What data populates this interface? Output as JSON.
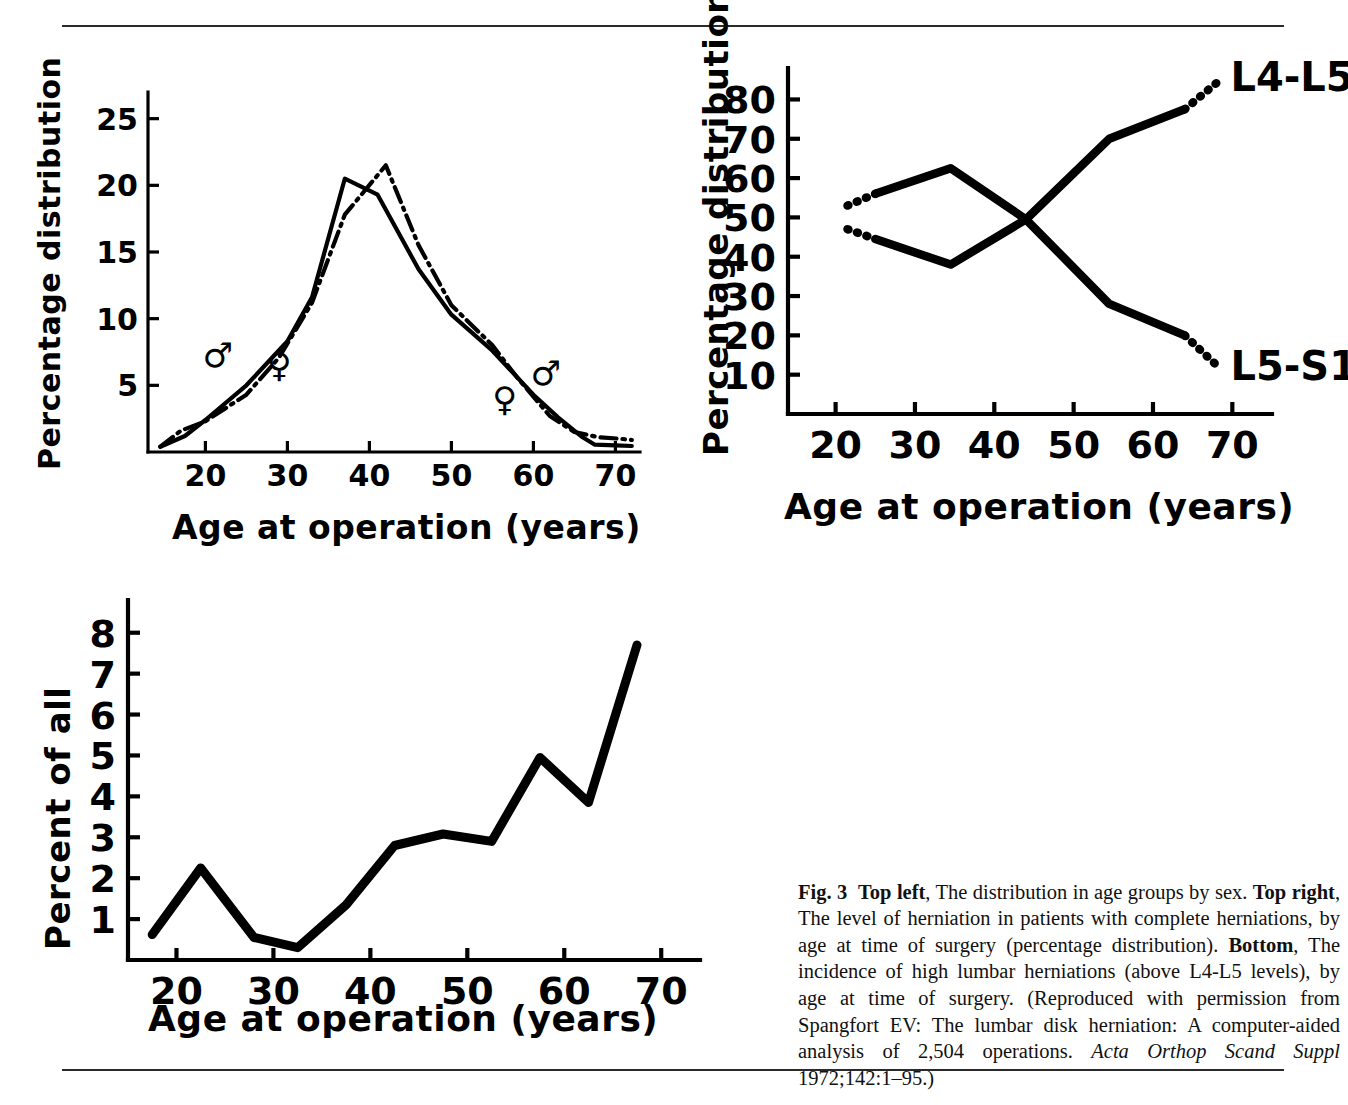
{
  "page": {
    "figure_number": "Fig. 3",
    "rules": [
      "top-rule",
      "bottom-rule"
    ]
  },
  "caption": {
    "figure_label": "Fig. 3",
    "seg_top_left_label": "Top left",
    "seg_top_left_text": ", The distribution in age groups by sex. ",
    "seg_top_right_label": "Top right",
    "seg_top_right_text": ", The level of herniation in patients with complete herniations, by age at time of surgery (percentage distribution). ",
    "seg_bottom_label": "Bottom",
    "seg_bottom_text": ", The incidence of high lumbar herniations (above L4-L5 levels), by age at time of surgery. (Reproduced with permission from Spangfort EV: The lumbar disk herniation: A computer-aided analysis of 2,504 operations. ",
    "journal_italic": "Acta Orthop Scand Suppl",
    "citation_tail": " 1972;142:1–95.)",
    "full_text": "Fig. 3  Top left, The distribution in age groups by sex. Top right, The level of herniation in patients with complete herniations, by age at time of surgery (percentage distribution). Bottom, The incidence of high lumbar herniations (above L4-L5 levels), by age at time of surgery. (Reproduced with permission from Spangfort EV: The lumbar disk herniation: A computer-aided analysis of 2,504 operations. Acta Orthop Scand Suppl 1972;142:1–95.)"
  },
  "chart_data": [
    {
      "id": "top-left",
      "position": "Top left",
      "type": "line",
      "title": "",
      "xlabel": "Age at operation (years)",
      "ylabel": "Percentage distribution",
      "xlim": [
        13,
        73
      ],
      "ylim": [
        0,
        27
      ],
      "xticks": [
        20,
        30,
        40,
        50,
        60,
        70
      ],
      "yticks": [
        5,
        10,
        15,
        20,
        25
      ],
      "grid": false,
      "legend": "inline-symbols",
      "annotations": [
        {
          "label": "♂",
          "name": "male-symbol-left",
          "x": 21.5,
          "y": 6.4
        },
        {
          "label": "♀",
          "name": "female-symbol-left",
          "x": 29.0,
          "y": 5.6
        },
        {
          "label": "♂",
          "name": "male-symbol-right",
          "x": 61.5,
          "y": 5.0
        },
        {
          "label": "♀",
          "name": "female-symbol-right",
          "x": 56.5,
          "y": 3.1
        }
      ],
      "series": [
        {
          "name": "Male",
          "symbol": "♂",
          "style": "solid",
          "x": [
            14.5,
            17.5,
            20,
            25,
            30,
            33,
            37,
            41,
            46,
            50,
            55,
            60,
            63,
            66,
            67.5,
            70,
            72
          ],
          "y": [
            0.4,
            1.2,
            2.4,
            5.0,
            8.3,
            11.6,
            20.5,
            19.3,
            13.7,
            10.3,
            7.6,
            4.3,
            2.6,
            1.1,
            0.55,
            0.5,
            0.45
          ]
        },
        {
          "name": "Female",
          "symbol": "♀",
          "style": "dash-dot",
          "x": [
            14.5,
            17,
            20,
            25,
            29,
            33,
            37,
            42,
            46,
            50,
            55,
            58,
            62,
            65,
            68,
            70.5,
            72
          ],
          "y": [
            0.4,
            1.6,
            2.3,
            4.3,
            7.1,
            11.2,
            17.8,
            21.5,
            15.5,
            11.0,
            8.0,
            5.6,
            2.7,
            1.5,
            1.1,
            1.0,
            0.9
          ]
        }
      ]
    },
    {
      "id": "top-right",
      "position": "Top right",
      "type": "line",
      "title": "",
      "xlabel": "Age at operation (years)",
      "ylabel": "Percentage distribution",
      "xlim": [
        14,
        75
      ],
      "ylim": [
        0,
        88
      ],
      "xticks": [
        20,
        30,
        40,
        50,
        60,
        70
      ],
      "yticks": [
        10,
        20,
        30,
        40,
        50,
        60,
        70,
        80
      ],
      "grid": false,
      "legend": "end-labels",
      "series": [
        {
          "name": "L4-L5",
          "style": "solid-with-dotted-ends",
          "end_label": "L4-L5",
          "x": [
            21.5,
            25,
            34.5,
            44,
            54.5,
            64,
            68.5
          ],
          "y": [
            47,
            44.5,
            38,
            49.5,
            70,
            77.5,
            85
          ],
          "dotted_lead_x": [
            21.5,
            25
          ],
          "dotted_tail_x": [
            64,
            68.5
          ]
        },
        {
          "name": "L5-S1",
          "style": "solid-with-dotted-ends",
          "end_label": "L5-S1",
          "x": [
            21.5,
            25,
            34.5,
            44,
            54.5,
            64,
            68.5
          ],
          "y": [
            53,
            56,
            62.5,
            49.5,
            28,
            20,
            11.5
          ],
          "dotted_lead_x": [
            21.5,
            25
          ],
          "dotted_tail_x": [
            64,
            68.5
          ]
        }
      ]
    },
    {
      "id": "bottom",
      "position": "Bottom",
      "type": "line",
      "title": "",
      "xlabel": "Age at operation (years)",
      "ylabel": "Percent of all",
      "xlim": [
        15,
        74
      ],
      "ylim": [
        0,
        8.8
      ],
      "xticks": [
        20,
        30,
        40,
        50,
        60,
        70
      ],
      "yticks": [
        1,
        2,
        3,
        4,
        5,
        6,
        7,
        8
      ],
      "grid": false,
      "legend": "none",
      "series": [
        {
          "name": "High lumbar herniations (above L4-L5)",
          "style": "solid",
          "x": [
            17.5,
            22.5,
            28,
            32.5,
            37.5,
            42.5,
            47.5,
            52.5,
            57.5,
            62.5,
            67.5
          ],
          "y": [
            0.62,
            2.25,
            0.55,
            0.3,
            1.35,
            2.8,
            3.08,
            2.9,
            4.95,
            3.85,
            7.7
          ]
        }
      ]
    }
  ],
  "labels": {
    "axis_x_common": "Age at operation (years)",
    "axis_y_percentage": "Percentage distribution",
    "axis_y_percent_all": "Percent of all",
    "level_l4l5": "L4-L5",
    "level_l5s1": "L5-S1",
    "male_glyph": "♂",
    "female_glyph": "♀"
  },
  "colors": {
    "ink": "#000000",
    "rule": "#2a2a2a",
    "paper": "#ffffff"
  }
}
